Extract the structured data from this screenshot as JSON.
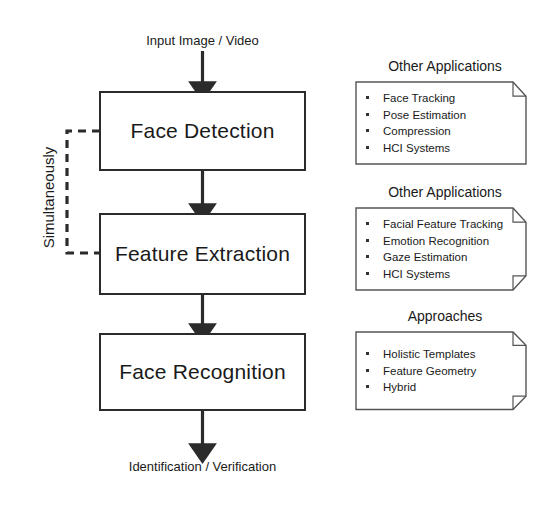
{
  "diagram": {
    "input_label": "Input Image / Video",
    "output_label": "Identification / Verification",
    "bracket_label": "Simultaneously",
    "stages": [
      {
        "label": "Face Detection"
      },
      {
        "label": "Feature Extraction"
      },
      {
        "label": "Face Recognition"
      }
    ],
    "annotations": [
      {
        "title": "Other Applications",
        "items": [
          "Face Tracking",
          "Pose Estimation",
          "Compression",
          "HCI Systems"
        ]
      },
      {
        "title": "Other Applications",
        "items": [
          "Facial Feature Tracking",
          "Emotion Recognition",
          "Gaze Estimation",
          "HCI Systems"
        ]
      },
      {
        "title": "Approaches",
        "items": [
          "Holistic Templates",
          "Feature Geometry",
          "Hybrid"
        ]
      }
    ],
    "colors": {
      "background": "#ffffff",
      "stroke": "#2b2b2b",
      "annotation_stroke": "#555555",
      "text": "#1a1a1a"
    }
  }
}
